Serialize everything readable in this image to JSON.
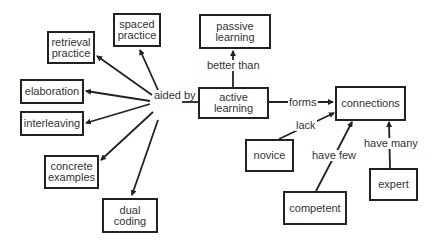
{
  "nodes": {
    "spaced_practice": "spaced practice",
    "retrieval_practice": "retrieval practice",
    "elaboration": "elaboration",
    "interleaving": "interleaving",
    "concrete_examples": "concrete examples",
    "dual_coding": "dual coding",
    "passive_learning": "passive learning",
    "active_learning": "active learning",
    "connections": "connections",
    "novice": "novice",
    "competent": "competent",
    "expert": "expert"
  },
  "edge_labels": {
    "aided_by": "aided by",
    "better_than": "better than",
    "forms": "forms",
    "lack": "lack",
    "have_few": "have few",
    "have_many": "have many"
  },
  "edges": [
    {
      "from": "active learning",
      "label": "aided by",
      "to": "spaced practice"
    },
    {
      "from": "active learning",
      "label": "aided by",
      "to": "retrieval practice"
    },
    {
      "from": "active learning",
      "label": "aided by",
      "to": "elaboration"
    },
    {
      "from": "active learning",
      "label": "aided by",
      "to": "interleaving"
    },
    {
      "from": "active learning",
      "label": "aided by",
      "to": "concrete examples"
    },
    {
      "from": "active learning",
      "label": "aided by",
      "to": "dual coding"
    },
    {
      "from": "active learning",
      "label": "better than",
      "to": "passive learning"
    },
    {
      "from": "active learning",
      "label": "forms",
      "to": "connections"
    },
    {
      "from": "novice",
      "label": "lack",
      "to": "connections"
    },
    {
      "from": "competent",
      "label": "have few",
      "to": "connections"
    },
    {
      "from": "expert",
      "label": "have many",
      "to": "connections"
    }
  ],
  "colors": {
    "stroke": "#222222",
    "text": "#333333",
    "background": "#ffffff"
  }
}
